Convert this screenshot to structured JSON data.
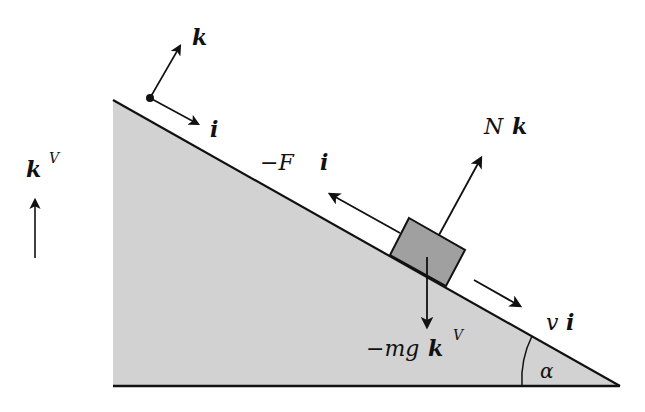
{
  "diagram": {
    "colors": {
      "incline_fill": "#d2d2d2",
      "block_fill": "#a0a0a0",
      "stroke": "#111111",
      "background": "#ffffff"
    },
    "incline": {
      "top": [
        113,
        100
      ],
      "bottom_left": [
        113,
        386
      ],
      "bottom_right": [
        620,
        386
      ]
    },
    "angle_label": "α",
    "labels": {
      "k_body": "k",
      "i_body": "i",
      "k_vertical": "k",
      "k_vertical_sup": "V",
      "friction": "−F",
      "friction_vec": "i",
      "normal": "N",
      "normal_vec": "k",
      "velocity": "v",
      "velocity_vec": "i",
      "gravity": "−mg",
      "gravity_vec": "k",
      "gravity_sup": "V"
    },
    "forces": [
      {
        "name": "friction",
        "label": "−F i",
        "direction": "up-slope"
      },
      {
        "name": "normal",
        "label": "N k",
        "direction": "perpendicular to slope"
      },
      {
        "name": "gravity",
        "label": "−mg k^V",
        "direction": "down"
      },
      {
        "name": "velocity",
        "label": "v i",
        "direction": "down-slope"
      }
    ]
  }
}
